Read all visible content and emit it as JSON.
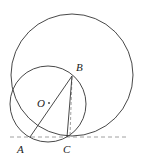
{
  "diagram": {
    "type": "geometry",
    "points": {
      "A": {
        "label": "A",
        "x": 30,
        "y": 137
      },
      "B": {
        "label": "B",
        "x": 72,
        "y": 76
      },
      "C": {
        "label": "C",
        "x": 67,
        "y": 137
      },
      "O": {
        "label": "O",
        "x": 49,
        "y": 103
      }
    },
    "circles": [
      {
        "name": "large-circle",
        "cx": 72,
        "cy": 75,
        "r": 61
      },
      {
        "name": "circle-O",
        "cx": 48,
        "cy": 104,
        "r": 38
      }
    ],
    "segments": [
      "AB",
      "BC"
    ],
    "dashed": [
      "tangent-line through A and C",
      "B perpendicular to C"
    ],
    "colors": {
      "stroke": "#333333",
      "dash": "#888888"
    }
  }
}
